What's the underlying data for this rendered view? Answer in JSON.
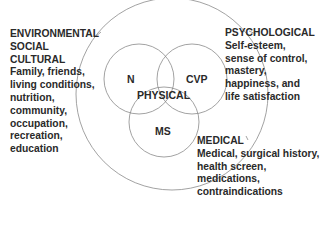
{
  "diagram": {
    "outer_circle_label": "PHYSICAL",
    "inner_circles": [
      {
        "label": "N"
      },
      {
        "label": "CVP"
      },
      {
        "label": "MS"
      }
    ],
    "center_label": "PHYSICAL"
  },
  "environmental": {
    "headings": [
      "ENVIRONMENTAL",
      "SOCIAL",
      "CULTURAL"
    ],
    "lines": [
      "Family, friends,",
      "living conditions,",
      "nutrition,",
      "community,",
      "occupation,",
      "recreation,",
      "education"
    ]
  },
  "psychological": {
    "heading": "PSYCHOLOGICAL",
    "lines": [
      "Self-esteem,",
      "sense of control,",
      "mastery,",
      "happiness, and",
      "life satisfaction"
    ]
  },
  "medical": {
    "heading": "MEDICAL",
    "lines": [
      "Medical, surgical history,",
      "health screen,",
      "medications,",
      "contraindications"
    ]
  },
  "colors": {
    "line": "#8a8a8a",
    "text": "#2a2a2a"
  }
}
